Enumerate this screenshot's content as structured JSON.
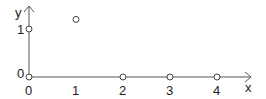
{
  "chart_data": {
    "type": "scatter",
    "title": "",
    "xlabel": "x",
    "ylabel": "y",
    "x_ticks": [
      "0",
      "1",
      "2",
      "3",
      "4"
    ],
    "y_ticks": [
      "0",
      "1"
    ],
    "points": [
      {
        "x": 0,
        "y": 1
      },
      {
        "x": 1,
        "y": 1.2
      },
      {
        "x": 0,
        "y": 0
      },
      {
        "x": 2,
        "y": 0
      },
      {
        "x": 3,
        "y": 0
      },
      {
        "x": 4,
        "y": 0
      }
    ],
    "marker": "open-circle",
    "xlim": [
      0,
      4.6
    ],
    "ylim": [
      0,
      1.6
    ],
    "grid": false,
    "legend": null,
    "color": "#444444"
  }
}
